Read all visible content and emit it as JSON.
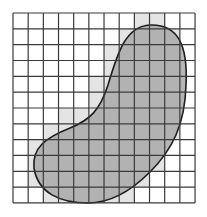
{
  "diagram": {
    "type": "area-approximation-grid",
    "grid": {
      "columns": 12,
      "rows": 12,
      "origin_x": 13,
      "origin_y": 13,
      "cell_width": 15.17,
      "cell_height": 15.83
    },
    "colors": {
      "background": "#ffffff",
      "grid_line": "#3a3a3a",
      "outer_cells": "#e4e4e4",
      "blob_fill": "#a9a9a9",
      "blob_outline": "#1e1e1e"
    },
    "outer_approximation_cells": [
      [
        8,
        9
      ],
      [
        7,
        8,
        9,
        10
      ],
      [
        6,
        7,
        8,
        9,
        10
      ],
      [
        6,
        7,
        8,
        9,
        10
      ],
      [
        5,
        6,
        7,
        8,
        9,
        10
      ],
      [
        5,
        6,
        7,
        8,
        9,
        10
      ],
      [
        3,
        4,
        5,
        6,
        7,
        8,
        9,
        10
      ],
      [
        2,
        3,
        4,
        5,
        6,
        7,
        8,
        9,
        10
      ],
      [
        1,
        2,
        3,
        4,
        5,
        6,
        7,
        8,
        9
      ],
      [
        1,
        2,
        3,
        4,
        5,
        6,
        7,
        8,
        9
      ],
      [
        1,
        2,
        3,
        4,
        5,
        6,
        7,
        8
      ],
      [
        2,
        3,
        4,
        5,
        6,
        7
      ]
    ],
    "shape": {
      "name": "kidney-shaped region",
      "path": "M 150 25 C 178 24 188 45 186 85 C 185 125 172 150 150 172 C 130 192 110 203 88 203 C 60 203 38 193 34 168 C 32 148 45 138 70 128 C 90 120 100 110 108 85 C 117 55 125 26 150 25 Z"
    }
  }
}
